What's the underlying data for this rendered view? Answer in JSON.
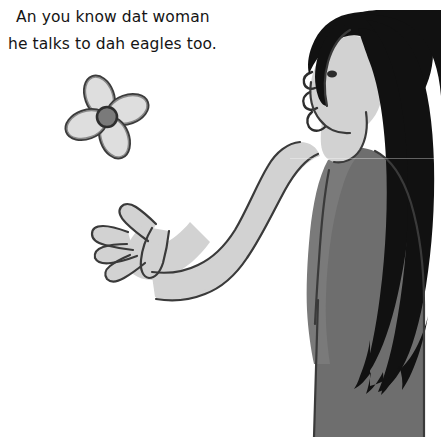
{
  "image": {
    "kind": "cartoon-illustration",
    "width": 441,
    "height": 437,
    "background_color": "#ffffff",
    "style": "grayscale"
  },
  "caption": {
    "line_1": "An you know dat woman",
    "line_2": "he talks to dah eagles too.",
    "text_color": "#141414"
  },
  "flower": {
    "name": "four-petal-flower",
    "petal_count": 4,
    "petal_fill": "#d8d8d8",
    "petal_outline": "#3b3b3b",
    "center_fill": "#7a7a7a",
    "center_outline": "#2e2e2e"
  },
  "figure": {
    "name": "woman-with-long-hair",
    "hair_color": "#111111",
    "skin_color": "#d2d2d2",
    "dress_color": "#6e6e6e",
    "outline_color": "#3a3a3a",
    "pose": "arm-outstretched-open-hand",
    "parts": {
      "hair": "long-black-hair",
      "face": "profile-face",
      "eye": "eye",
      "arm": "outstretched-arm",
      "hand": "open-hand-five-fingers",
      "dress": "gray-dress"
    }
  }
}
